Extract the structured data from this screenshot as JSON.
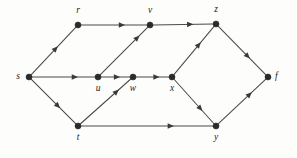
{
  "figure": {
    "background_color": "#fdfdfc",
    "node_color": "#2b2b2b",
    "edge_color": "#4a4a4a",
    "arrow_color": "#3a3a3a",
    "width": 297,
    "height": 158
  },
  "graph": {
    "type": "directed-graph",
    "node_count": 10,
    "edge_count": 14,
    "nodes": [
      {
        "id": "s",
        "label": "s",
        "x": 29,
        "y": 77,
        "label_pos": "left"
      },
      {
        "id": "r",
        "label": "r",
        "x": 78,
        "y": 25,
        "label_pos": "above"
      },
      {
        "id": "t",
        "label": "t",
        "x": 78,
        "y": 126,
        "label_pos": "below"
      },
      {
        "id": "u",
        "label": "u",
        "x": 98,
        "y": 77,
        "label_pos": "below"
      },
      {
        "id": "w",
        "label": "w",
        "x": 133,
        "y": 77,
        "label_pos": "below"
      },
      {
        "id": "v",
        "label": "v",
        "x": 150,
        "y": 25,
        "label_pos": "above"
      },
      {
        "id": "x",
        "label": "x",
        "x": 172,
        "y": 77,
        "label_pos": "below"
      },
      {
        "id": "z",
        "label": "z",
        "x": 216,
        "y": 24,
        "label_pos": "above"
      },
      {
        "id": "y",
        "label": "y",
        "x": 216,
        "y": 126,
        "label_pos": "below"
      },
      {
        "id": "f",
        "label": "f",
        "x": 268,
        "y": 77,
        "label_pos": "right"
      }
    ],
    "edges": [
      {
        "from": "s",
        "to": "r",
        "arrow_t": 0.55
      },
      {
        "from": "s",
        "to": "u",
        "arrow_t": 0.68
      },
      {
        "from": "s",
        "to": "t",
        "arrow_t": 0.6
      },
      {
        "from": "r",
        "to": "v",
        "arrow_t": 0.62
      },
      {
        "from": "v",
        "to": "z",
        "arrow_t": 0.62
      },
      {
        "from": "u",
        "to": "v",
        "arrow_t": 0.78
      },
      {
        "from": "u",
        "to": "w",
        "arrow_t": 0.55
      },
      {
        "from": "w",
        "to": "x",
        "arrow_t": 0.62
      },
      {
        "from": "t",
        "to": "w",
        "arrow_t": 0.72
      },
      {
        "from": "t",
        "to": "y",
        "arrow_t": 0.68
      },
      {
        "from": "x",
        "to": "z",
        "arrow_t": 0.62
      },
      {
        "from": "x",
        "to": "y",
        "arrow_t": 0.66
      },
      {
        "from": "z",
        "to": "f",
        "arrow_t": 0.62
      },
      {
        "from": "y",
        "to": "f",
        "arrow_t": 0.66
      }
    ]
  }
}
